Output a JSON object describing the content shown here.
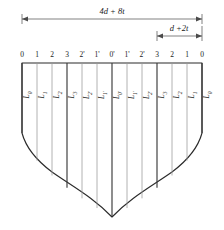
{
  "figure": {
    "dimensions": [
      {
        "id": "overall",
        "label": "4d + 8t",
        "from_tick": 0,
        "to_tick": 12
      },
      {
        "id": "partial",
        "label": "d +2t",
        "from_tick": 9,
        "to_tick": 12
      }
    ],
    "tick_labels": [
      "0",
      "1",
      "2",
      "3",
      "2'",
      "1'",
      "0'",
      "1'",
      "2'",
      "3",
      "2",
      "1",
      "0"
    ],
    "tick_x": [
      22,
      37,
      52,
      67,
      82,
      97,
      112,
      127,
      142,
      157,
      172,
      187,
      202
    ],
    "major_ticks": [
      0,
      3,
      6,
      9,
      12
    ],
    "segment_labels": [
      "L0",
      "L1",
      "L2",
      "L3",
      "L2'",
      "L1'",
      "L0'",
      "L1'",
      "L2'",
      "L3",
      "L2",
      "L1",
      "L0"
    ],
    "segment_labels_sub": [
      "0",
      "1",
      "2",
      "3",
      "2'",
      "1'",
      "0'",
      "1'",
      "2'",
      "3",
      "2",
      "1",
      "0"
    ],
    "segment_label_base": "L",
    "colors": {
      "outline": "#2b2b2b",
      "rib_major": "#3a3a3a",
      "rib_minor": "#9a9a9a",
      "dimension": "#4a4a4a",
      "background": "#ffffff"
    }
  }
}
